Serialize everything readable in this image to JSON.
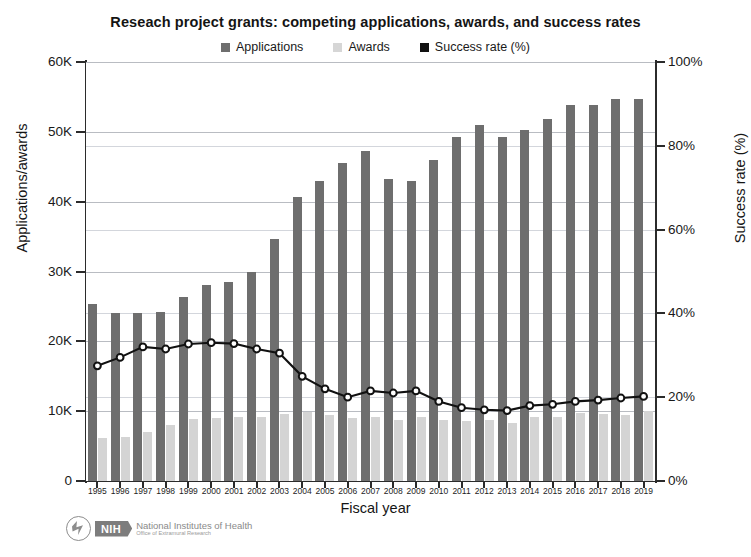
{
  "chart_data": {
    "type": "bar",
    "title": "Reseach project grants: competing applications, awards, and success rates",
    "xlabel": "Fiscal year",
    "ylabel": "Applications/awards",
    "ylabel_right": "Success rate (%)",
    "ylim": [
      0,
      60000
    ],
    "ylim_right": [
      0,
      100
    ],
    "ytick_labels": [
      "60K",
      "50K",
      "40K",
      "30K",
      "20K",
      "10K",
      "0"
    ],
    "ytick_values": [
      60000,
      50000,
      40000,
      30000,
      20000,
      10000,
      0
    ],
    "ytick_labels_right": [
      "100%",
      "80%",
      "60%",
      "40%",
      "20%",
      "0%"
    ],
    "ytick_values_right": [
      100,
      80,
      60,
      40,
      20,
      0
    ],
    "grid": true,
    "legend_position": "top-center",
    "categories": [
      "1995",
      "1996",
      "1997",
      "1998",
      "1999",
      "2000",
      "2001",
      "2002",
      "2003",
      "2004",
      "2005",
      "2006",
      "2007",
      "2008",
      "2009",
      "2010",
      "2011",
      "2012",
      "2013",
      "2014",
      "2015",
      "2016",
      "2017",
      "2018",
      "2019"
    ],
    "series": [
      {
        "name": "Applications",
        "axis": "left",
        "color": "#6e6e6e",
        "type": "bar",
        "values": [
          25300,
          24000,
          24100,
          24200,
          26400,
          28000,
          28500,
          30000,
          34700,
          40700,
          42900,
          45500,
          47200,
          43300,
          43000,
          46000,
          49300,
          51000,
          49200,
          50300,
          51800,
          53900,
          53800,
          54700,
          54700
        ]
      },
      {
        "name": "Awards",
        "axis": "left",
        "color": "#d4d4d4",
        "type": "bar",
        "values": [
          6200,
          6300,
          7000,
          8000,
          8900,
          9000,
          9100,
          9200,
          9600,
          9900,
          9400,
          9000,
          9200,
          8800,
          9100,
          8700,
          8600,
          8700,
          8300,
          9200,
          9200,
          9700,
          9600,
          9400,
          10000
        ]
      },
      {
        "name": "Success rate (%)",
        "axis": "right",
        "color": "#111111",
        "type": "line",
        "values": [
          27.5,
          29.5,
          32.0,
          31.5,
          32.7,
          33.0,
          32.8,
          31.5,
          30.5,
          25.0,
          22.0,
          20.0,
          21.5,
          21.0,
          21.5,
          19.0,
          17.5,
          17.0,
          16.8,
          18.0,
          18.3,
          19.0,
          19.3,
          19.8,
          20.2
        ]
      }
    ]
  },
  "legend": {
    "items": [
      {
        "label": "Applications",
        "color": "#6e6e6e"
      },
      {
        "label": "Awards",
        "color": "#d6d6d6"
      },
      {
        "label": "Success rate (%)",
        "color": "#111111"
      }
    ]
  },
  "logo": {
    "badge": "NIH",
    "line1": "National Institutes of Health",
    "line2": "Office of Extramural Research"
  }
}
